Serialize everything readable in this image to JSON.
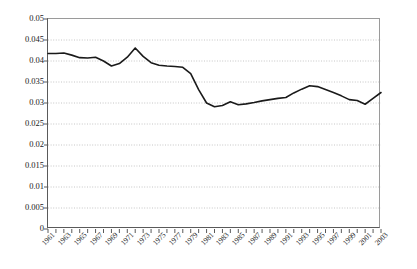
{
  "chart_data": {
    "type": "line",
    "title": "",
    "subtitle": "",
    "xlabel": "",
    "ylabel": "",
    "grid": "horizontal-dotted",
    "legend": "none",
    "ylim": [
      0,
      0.05
    ],
    "ytick_step": 0.005,
    "ytick_labels": [
      "0.05",
      "0.045",
      "0.04",
      "0.035",
      "0.03",
      "0.025",
      "0.02",
      "0.015",
      "0.01",
      "0.005",
      "0"
    ],
    "ytick_values": [
      0.05,
      0.045,
      0.04,
      0.035,
      0.03,
      0.025,
      0.02,
      0.015,
      0.01,
      0.005,
      0
    ],
    "xlim": [
      1961,
      2003
    ],
    "xtick_labels": [
      "1961",
      "1963",
      "1965",
      "1967",
      "1969",
      "1971",
      "1973",
      "1975",
      "1977",
      "1979",
      "1981",
      "1983",
      "1985",
      "1987",
      "1989",
      "1991",
      "1993",
      "1995",
      "1997",
      "1999",
      "2001",
      "2003"
    ],
    "xtick_every_year": true,
    "series_color": "#1a1a1a",
    "series_width": 1.6,
    "x": [
      1961,
      1962,
      1963,
      1964,
      1965,
      1966,
      1967,
      1968,
      1969,
      1970,
      1971,
      1972,
      1973,
      1974,
      1975,
      1976,
      1977,
      1978,
      1979,
      1980,
      1981,
      1982,
      1983,
      1984,
      1985,
      1986,
      1987,
      1988,
      1989,
      1990,
      1991,
      1992,
      1993,
      1994,
      1995,
      1996,
      1997,
      1998,
      1999,
      2000,
      2001,
      2002,
      2003
    ],
    "values": [
      0.0418,
      0.0418,
      0.0419,
      0.0414,
      0.0408,
      0.0407,
      0.0409,
      0.04,
      0.0388,
      0.0394,
      0.0409,
      0.0431,
      0.0411,
      0.0396,
      0.039,
      0.0388,
      0.0387,
      0.0385,
      0.037,
      0.0332,
      0.03,
      0.0291,
      0.0294,
      0.0303,
      0.0296,
      0.0298,
      0.0301,
      0.0305,
      0.0308,
      0.0311,
      0.0313,
      0.0324,
      0.0333,
      0.0341,
      0.0339,
      0.0332,
      0.0325,
      0.0317,
      0.0308,
      0.0306,
      0.0297,
      0.0311,
      0.0325
    ],
    "series": [
      {
        "name": "series-1",
        "values": [
          0.0418,
          0.0418,
          0.0419,
          0.0414,
          0.0408,
          0.0407,
          0.0409,
          0.04,
          0.0388,
          0.0394,
          0.0409,
          0.0431,
          0.0411,
          0.0396,
          0.039,
          0.0388,
          0.0387,
          0.0385,
          0.037,
          0.0332,
          0.03,
          0.0291,
          0.0294,
          0.0303,
          0.0296,
          0.0298,
          0.0301,
          0.0305,
          0.0308,
          0.0311,
          0.0313,
          0.0324,
          0.0333,
          0.0341,
          0.0339,
          0.0332,
          0.0325,
          0.0317,
          0.0308,
          0.0306,
          0.0297,
          0.0311,
          0.0325
        ]
      }
    ]
  }
}
